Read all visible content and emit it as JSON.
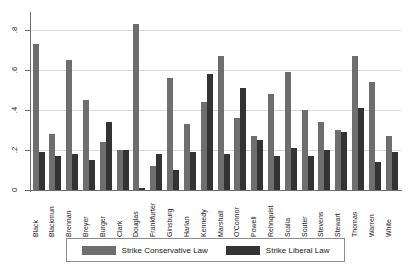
{
  "chart_data": {
    "type": "bar",
    "title": "",
    "xlabel": "",
    "ylabel": "",
    "ylim": [
      0,
      0.9
    ],
    "grid": true,
    "legend_position": "bottom",
    "ytick_labels": [
      "0",
      ".2",
      ".4",
      ".6",
      ".8"
    ],
    "ytick_values": [
      0,
      0.2,
      0.4,
      0.6,
      0.8
    ],
    "categories": [
      "Black",
      "Blackmun",
      "Brennan",
      "Breyer",
      "Burger",
      "Clark",
      "Douglas",
      "Frankfurter",
      "Ginsburg",
      "Harlan",
      "Kennedy",
      "Marshall",
      "O'Connor",
      "Powell",
      "Rehnquist",
      "Scalia",
      "Souter",
      "Stevens",
      "Stewart",
      "Thomas",
      "Warren",
      "White"
    ],
    "series": [
      {
        "name": "Strike Conservative Law",
        "color": "#6e6e6e",
        "values": [
          0.73,
          0.28,
          0.65,
          0.45,
          0.24,
          0.2,
          0.83,
          0.12,
          0.56,
          0.33,
          0.44,
          0.67,
          0.36,
          0.27,
          0.48,
          0.59,
          0.4,
          0.34,
          0.3,
          0.67,
          0.54,
          0.27
        ]
      },
      {
        "name": "Strike Liberal Law",
        "color": "#333333",
        "values": [
          0.19,
          0.17,
          0.18,
          0.15,
          0.34,
          0.2,
          0.01,
          0.18,
          0.1,
          0.19,
          0.58,
          0.18,
          0.51,
          0.25,
          0.17,
          0.21,
          0.17,
          0.2,
          0.29,
          0.41,
          0.14,
          0.19
        ]
      }
    ]
  },
  "legend": {
    "entries": [
      {
        "label": "Strike Conservative Law",
        "color": "#6e6e6e"
      },
      {
        "label": "Strike Liberal Law",
        "color": "#333333"
      }
    ]
  }
}
